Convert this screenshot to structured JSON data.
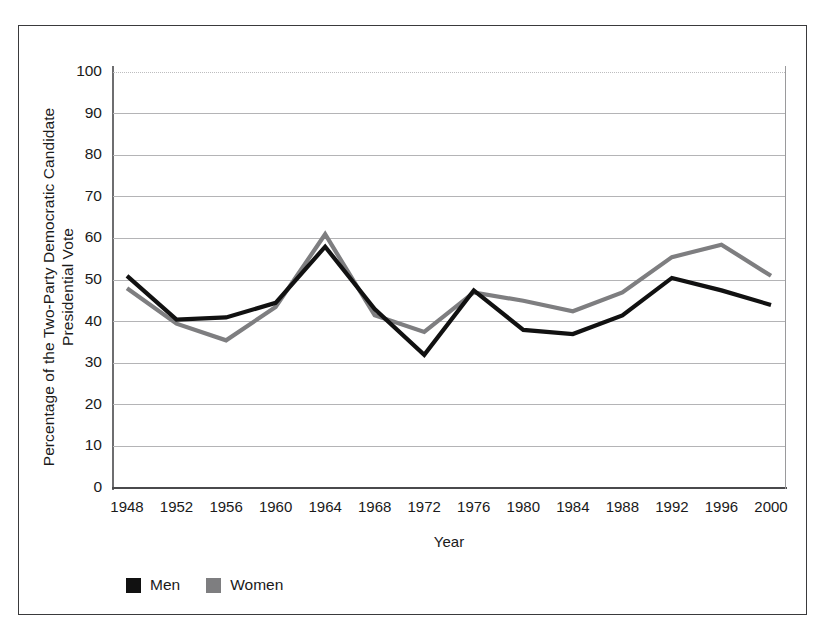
{
  "chart_data": {
    "type": "line",
    "title": "",
    "xlabel": "Year",
    "ylabel": "Percentage of the Two-Party Democratic Candidate\nPresidential Vote",
    "categories": [
      "1948",
      "1952",
      "1956",
      "1960",
      "1964",
      "1968",
      "1972",
      "1976",
      "1980",
      "1984",
      "1988",
      "1992",
      "1996",
      "2000"
    ],
    "x": [
      1948,
      1952,
      1956,
      1960,
      1964,
      1968,
      1972,
      1976,
      1980,
      1984,
      1988,
      1992,
      1996,
      2000
    ],
    "ylim": [
      0,
      100
    ],
    "yticks": [
      0,
      10,
      20,
      30,
      40,
      50,
      60,
      70,
      80,
      90,
      100
    ],
    "grid": true,
    "legend_position": "below-left",
    "series": [
      {
        "name": "Men",
        "color": "#111111",
        "values": [
          51,
          40.5,
          41,
          44.5,
          58,
          43,
          32,
          47.5,
          38,
          37,
          41.5,
          50.5,
          47.5,
          44
        ]
      },
      {
        "name": "Women",
        "color": "#7e7e80",
        "values": [
          48,
          39.5,
          35.5,
          43.5,
          61,
          41.5,
          37.5,
          47,
          45,
          42.5,
          47,
          55.5,
          58.5,
          51
        ]
      }
    ]
  },
  "axes": {
    "y_title": "Percentage of the Two-Party Democratic Candidate\nPresidential Vote",
    "x_title": "Year",
    "y_tick_labels": [
      "100",
      "90",
      "80",
      "70",
      "60",
      "50",
      "40",
      "30",
      "20",
      "10",
      "0"
    ],
    "x_tick_labels": [
      "1948",
      "1952",
      "1956",
      "1960",
      "1964",
      "1968",
      "1972",
      "1976",
      "1980",
      "1984",
      "1988",
      "1992",
      "1996",
      "2000"
    ]
  },
  "legend": {
    "items": [
      {
        "label": "Men",
        "color": "#111111"
      },
      {
        "label": "Women",
        "color": "#7e7e80"
      }
    ]
  },
  "colors": {
    "men_line": "#111111",
    "women_line": "#7e7e80",
    "gridline": "#b4b4b6",
    "frame": "#3a3a3c",
    "background": "#ffffff"
  }
}
